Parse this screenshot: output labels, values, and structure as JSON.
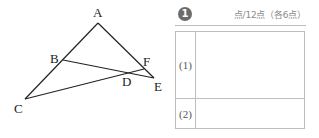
{
  "figure": {
    "points": [
      {
        "name": "A",
        "label": "A"
      },
      {
        "name": "B",
        "label": "B"
      },
      {
        "name": "C",
        "label": "C"
      },
      {
        "name": "D",
        "label": "D"
      },
      {
        "name": "E",
        "label": "E"
      },
      {
        "name": "F",
        "label": "F"
      }
    ],
    "segments": [
      [
        "A",
        "C"
      ],
      [
        "A",
        "E"
      ],
      [
        "B",
        "E"
      ],
      [
        "C",
        "F"
      ]
    ]
  },
  "answer_box": {
    "problem_number": "1",
    "score_text": "点/12点（各6点）",
    "rows": [
      {
        "label": "(1)",
        "answer": ""
      },
      {
        "label": "(2)",
        "answer": ""
      }
    ]
  }
}
